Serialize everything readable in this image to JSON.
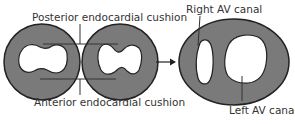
{
  "diagram": {
    "labels": {
      "posterior": "Posterior endocardial cushion",
      "anterior": "Anterior endocardial cushion",
      "right_av": "Right AV canal",
      "left_av": "Left AV canal"
    },
    "colors": {
      "fill": "#7a7a7a",
      "stroke": "#222222",
      "hole": "#ffffff",
      "line": "#333333",
      "text": "#333333"
    },
    "elements": [
      {
        "name": "stage-1-cushions-separate",
        "shape": "circle"
      },
      {
        "name": "stage-2-cushions-approaching",
        "shape": "circle"
      },
      {
        "name": "transition-arrow",
        "shape": "arrow"
      },
      {
        "name": "stage-3-av-canals-divided",
        "shape": "ellipse"
      }
    ]
  }
}
